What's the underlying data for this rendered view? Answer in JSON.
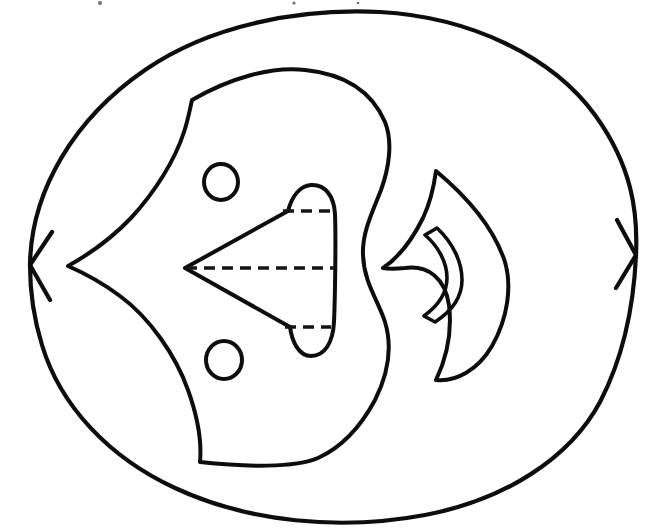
{
  "document": {
    "kind": "line-drawing",
    "title": "",
    "caption": "",
    "background_color": "#ffffff",
    "ink_color": "#0d0d0d",
    "width": 656,
    "height": 532
  },
  "figure": {
    "name": "abstract-outline-figure",
    "stroke_style": "hand-drawn ink outline",
    "fill": "none"
  },
  "shapes": {
    "outer_contour": {
      "label": "outer-contour",
      "note": "Large closed rounded outline, cusped at left (x30,y265) and right (x636,y255)",
      "path": "M 30 265 C 31 190 75 118 145 70 C 210 25 300 8 380 12 C 470 17 552 56 595 115 C 632 166 638 212 636 255 C 634 300 626 352 600 402 C 570 458 505 500 425 515 C 340 531 248 522 175 488 C 108 457 60 405 42 345 C 33 316 30 290 30 265 Z"
    },
    "outer_left_cusp": {
      "label": "outer-left-cusp",
      "path": "M 52 232 L 30 265 L 50 300"
    },
    "outer_right_cusp": {
      "label": "outer-right-cusp",
      "path": "M 617 220 L 636 255 L 616 288"
    },
    "inner_blob": {
      "label": "inner-blob",
      "note": "Large irregular region with a point at left (x68,y266), corner at upper-left (x192,y100) and lower-left (x200,y462)",
      "path": "M 192 100 C 230 78 272 66 305 70 C 345 74 372 92 385 122 C 393 142 389 168 381 190 C 372 213 362 233 363 255 C 364 283 378 300 385 322 C 392 345 389 372 375 400 C 360 428 340 448 318 458 C 295 468 245 467 200 462 C 202 440 197 415 188 390 C 176 356 150 318 120 296 C 104 284 84 273 68 266 C 86 256 110 240 131 218 C 155 192 175 160 184 132 C 188 120 190 109 192 100 Z"
    },
    "circle_upper": {
      "label": "small-circle-upper",
      "cx": 221,
      "cy": 182,
      "rx": 17,
      "ry": 18
    },
    "circle_lower": {
      "label": "small-circle-lower",
      "cx": 224,
      "cy": 360,
      "rx": 18,
      "ry": 19
    },
    "triangle": {
      "label": "left-pointing-triangle",
      "note": "Apex at left (x185,y268); upper vertex near (x288,y211); lower vertex near (x290,y327)",
      "path": "M 185 268 L 288 211 M 185 268 L 290 327"
    },
    "oval_cap": {
      "label": "rounded-oval-cap",
      "note": "Rounded oval forming the right edge of the triangle, from y=186 to y=355",
      "path": "M 288 211 C 292 196 300 186 311 185 C 325 184 334 196 335 214 C 336 240 335 300 334 322 C 333 342 325 356 311 356 C 299 356 292 342 290 327"
    },
    "dashed_lines": [
      {
        "label": "dashed-line-top",
        "x1": 283,
        "y1": 211,
        "x2": 333,
        "y2": 211
      },
      {
        "label": "dashed-line-middle",
        "x1": 186,
        "y1": 268,
        "x2": 334,
        "y2": 268
      },
      {
        "label": "dashed-line-bottom",
        "x1": 285,
        "y1": 327,
        "x2": 331,
        "y2": 327
      }
    ],
    "lens_shape": {
      "label": "lens-crescent-shape",
      "note": "Pointed top (x436,y171) and bottom (x436,y380); convex right edge out to x=510; concave left edge cusped at (x383,y268)",
      "path": "M 436 171 C 466 196 494 228 505 262 C 512 286 508 318 492 346 C 478 370 456 382 436 380 C 447 357 452 330 449 305 C 445 278 428 265 405 268 C 395 269 388 269 383 268 C 398 258 412 240 423 218 C 430 203 434 186 436 171 Z"
    },
    "lens_inner_arc": {
      "label": "inner-crescent-arc",
      "note": "Thin crescent opening to the left, inside the lens shape",
      "path": "M 437 228 C 453 243 462 262 462 280 C 462 297 452 311 435 322 L 424 316 C 439 305 447 293 447 278 C 447 262 438 246 425 235 Z"
    },
    "specks": [
      {
        "label": "scan-speck-1",
        "cx": 100,
        "cy": 3,
        "r": 2
      },
      {
        "label": "scan-speck-2",
        "cx": 294,
        "cy": 3,
        "r": 1.6
      },
      {
        "label": "scan-speck-3",
        "cx": 358,
        "cy": 3,
        "r": 1.3
      }
    ]
  }
}
